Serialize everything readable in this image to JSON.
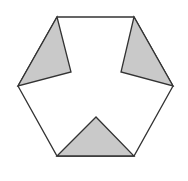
{
  "diagram": {
    "shape": "regular hexagon with three shaded triangles",
    "colors": {
      "background": "#ffffff",
      "stroke": "#333333",
      "fill_shaded": "#c9c9c9",
      "fill_white": "#ffffff"
    },
    "hexagon": {
      "vertices": [
        [
          57,
          17
        ],
        [
          134,
          17
        ],
        [
          173,
          86
        ],
        [
          134,
          156
        ],
        [
          57,
          156
        ],
        [
          18,
          86
        ]
      ]
    },
    "shaded_triangles": [
      {
        "name": "upper-left",
        "points": [
          [
            57,
            17
          ],
          [
            71,
            72
          ],
          [
            18,
            86
          ]
        ]
      },
      {
        "name": "upper-right",
        "points": [
          [
            134,
            17
          ],
          [
            121,
            72
          ],
          [
            173,
            86
          ]
        ]
      },
      {
        "name": "bottom",
        "points": [
          [
            57,
            156
          ],
          [
            96,
            117
          ],
          [
            134,
            156
          ]
        ]
      }
    ]
  }
}
